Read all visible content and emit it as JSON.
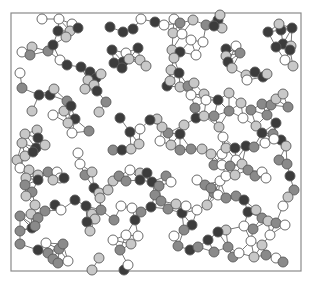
{
  "diagram": {
    "type": "network-graph",
    "frame": {
      "x": 11,
      "y": 13,
      "width": 290,
      "height": 258
    },
    "node_radius": 5,
    "colors": {
      "white": "#ffffff",
      "light": "#c8c8c8",
      "medium": "#8a8a8a",
      "dark": "#3c3c3c",
      "edge": "#6a6a6a",
      "frame": "#8a8a8a"
    },
    "nodes": [
      [
        42,
        19,
        "w"
      ],
      [
        59,
        19,
        "w"
      ],
      [
        72,
        24,
        "w"
      ],
      [
        58,
        31,
        "d"
      ],
      [
        70,
        31,
        "l"
      ],
      [
        66,
        37,
        "l"
      ],
      [
        78,
        28,
        "d"
      ],
      [
        22,
        52,
        "w"
      ],
      [
        32,
        47,
        "l"
      ],
      [
        30,
        55,
        "m"
      ],
      [
        48,
        51,
        "m"
      ],
      [
        53,
        45,
        "d"
      ],
      [
        60,
        60,
        "w"
      ],
      [
        67,
        65,
        "d"
      ],
      [
        20,
        73,
        "w"
      ],
      [
        22,
        88,
        "m"
      ],
      [
        39,
        95,
        "d"
      ],
      [
        50,
        95,
        "d"
      ],
      [
        54,
        89,
        "l"
      ],
      [
        32,
        111,
        "l"
      ],
      [
        53,
        115,
        "w"
      ],
      [
        64,
        111,
        "l"
      ],
      [
        67,
        101,
        "m"
      ],
      [
        71,
        106,
        "d"
      ],
      [
        75,
        119,
        "d"
      ],
      [
        68,
        123,
        "l"
      ],
      [
        72,
        133,
        "w"
      ],
      [
        89,
        131,
        "m"
      ],
      [
        25,
        134,
        "l"
      ],
      [
        37,
        130,
        "l"
      ],
      [
        38,
        138,
        "d"
      ],
      [
        22,
        143,
        "l"
      ],
      [
        36,
        148,
        "d"
      ],
      [
        45,
        145,
        "l"
      ],
      [
        110,
        27,
        "d"
      ],
      [
        123,
        32,
        "d"
      ],
      [
        133,
        29,
        "d"
      ],
      [
        141,
        19,
        "w"
      ],
      [
        155,
        22,
        "d"
      ],
      [
        112,
        50,
        "d"
      ],
      [
        126,
        53,
        "w"
      ],
      [
        138,
        48,
        "d"
      ],
      [
        123,
        62,
        "d"
      ],
      [
        129,
        59,
        "l"
      ],
      [
        140,
        60,
        "l"
      ],
      [
        146,
        66,
        "l"
      ],
      [
        114,
        63,
        "d"
      ],
      [
        122,
        68,
        "d"
      ],
      [
        81,
        67,
        "d"
      ],
      [
        90,
        72,
        "d"
      ],
      [
        96,
        78,
        "d"
      ],
      [
        101,
        74,
        "l"
      ],
      [
        88,
        80,
        "l"
      ],
      [
        94,
        85,
        "l"
      ],
      [
        85,
        89,
        "l"
      ],
      [
        97,
        91,
        "d"
      ],
      [
        106,
        102,
        "m"
      ],
      [
        99,
        112,
        "l"
      ],
      [
        120,
        118,
        "d"
      ],
      [
        130,
        132,
        "d"
      ],
      [
        140,
        129,
        "w"
      ],
      [
        113,
        150,
        "m"
      ],
      [
        122,
        150,
        "d"
      ],
      [
        131,
        149,
        "l"
      ],
      [
        139,
        144,
        "l"
      ],
      [
        164,
        25,
        "w"
      ],
      [
        174,
        19,
        "w"
      ],
      [
        180,
        23,
        "m"
      ],
      [
        193,
        20,
        "l"
      ],
      [
        206,
        25,
        "m"
      ],
      [
        218,
        20,
        "d"
      ],
      [
        222,
        28,
        "l"
      ],
      [
        220,
        15,
        "l"
      ],
      [
        214,
        26,
        "d"
      ],
      [
        173,
        33,
        "l"
      ],
      [
        182,
        34,
        "w"
      ],
      [
        191,
        40,
        "w"
      ],
      [
        203,
        42,
        "w"
      ],
      [
        172,
        50,
        "l"
      ],
      [
        180,
        52,
        "d"
      ],
      [
        174,
        58,
        "l"
      ],
      [
        196,
        55,
        "w"
      ],
      [
        226,
        49,
        "d"
      ],
      [
        236,
        46,
        "w"
      ],
      [
        240,
        53,
        "m"
      ],
      [
        226,
        56,
        "l"
      ],
      [
        228,
        62,
        "d"
      ],
      [
        232,
        68,
        "l"
      ],
      [
        246,
        75,
        "l"
      ],
      [
        255,
        72,
        "d"
      ],
      [
        247,
        80,
        "w"
      ],
      [
        263,
        77,
        "d"
      ],
      [
        267,
        74,
        "l"
      ],
      [
        268,
        32,
        "d"
      ],
      [
        281,
        30,
        "d"
      ],
      [
        292,
        28,
        "d"
      ],
      [
        279,
        24,
        "l"
      ],
      [
        283,
        44,
        "d"
      ],
      [
        291,
        46,
        "l"
      ],
      [
        276,
        47,
        "d"
      ],
      [
        290,
        50,
        "d"
      ],
      [
        285,
        60,
        "w"
      ],
      [
        293,
        66,
        "l"
      ],
      [
        171,
        70,
        "l"
      ],
      [
        179,
        73,
        "d"
      ],
      [
        167,
        86,
        "d"
      ],
      [
        170,
        81,
        "l"
      ],
      [
        180,
        87,
        "l"
      ],
      [
        188,
        86,
        "m"
      ],
      [
        194,
        83,
        "l"
      ],
      [
        191,
        95,
        "w"
      ],
      [
        204,
        94,
        "l"
      ],
      [
        206,
        100,
        "w"
      ],
      [
        218,
        100,
        "d"
      ],
      [
        229,
        93,
        "l"
      ],
      [
        229,
        111,
        "m"
      ],
      [
        241,
        103,
        "l"
      ],
      [
        251,
        110,
        "m"
      ],
      [
        262,
        104,
        "m"
      ],
      [
        271,
        105,
        "m"
      ],
      [
        267,
        115,
        "m"
      ],
      [
        276,
        99,
        "l"
      ],
      [
        283,
        94,
        "l"
      ],
      [
        288,
        107,
        "m"
      ],
      [
        276,
        123,
        "d"
      ],
      [
        273,
        134,
        "m"
      ],
      [
        281,
        140,
        "d"
      ],
      [
        286,
        146,
        "l"
      ],
      [
        195,
        108,
        "m"
      ],
      [
        196,
        118,
        "d"
      ],
      [
        204,
        116,
        "l"
      ],
      [
        214,
        116,
        "m"
      ],
      [
        219,
        127,
        "l"
      ],
      [
        223,
        137,
        "w"
      ],
      [
        243,
        118,
        "w"
      ],
      [
        256,
        126,
        "l"
      ],
      [
        262,
        133,
        "d"
      ],
      [
        265,
        143,
        "w"
      ],
      [
        274,
        139,
        "w"
      ],
      [
        184,
        125,
        "l"
      ],
      [
        180,
        134,
        "d"
      ],
      [
        168,
        133,
        "m"
      ],
      [
        162,
        127,
        "l"
      ],
      [
        157,
        119,
        "l"
      ],
      [
        150,
        120,
        "d"
      ],
      [
        160,
        141,
        "w"
      ],
      [
        171,
        145,
        "l"
      ],
      [
        180,
        150,
        "m"
      ],
      [
        191,
        149,
        "m"
      ],
      [
        202,
        149,
        "l"
      ],
      [
        17,
        160,
        "l"
      ],
      [
        25,
        156,
        "l"
      ],
      [
        33,
        152,
        "d"
      ],
      [
        20,
        168,
        "w"
      ],
      [
        29,
        170,
        "l"
      ],
      [
        26,
        178,
        "l"
      ],
      [
        38,
        175,
        "l"
      ],
      [
        48,
        172,
        "m"
      ],
      [
        57,
        172,
        "w"
      ],
      [
        60,
        178,
        "w"
      ],
      [
        64,
        178,
        "d"
      ],
      [
        53,
        180,
        "l"
      ],
      [
        25,
        185,
        "m"
      ],
      [
        38,
        180,
        "d"
      ],
      [
        32,
        192,
        "m"
      ],
      [
        26,
        196,
        "l"
      ],
      [
        35,
        205,
        "l"
      ],
      [
        45,
        211,
        "m"
      ],
      [
        55,
        205,
        "d"
      ],
      [
        61,
        210,
        "w"
      ],
      [
        20,
        216,
        "m"
      ],
      [
        31,
        214,
        "l"
      ],
      [
        38,
        218,
        "m"
      ],
      [
        20,
        231,
        "m"
      ],
      [
        32,
        228,
        "d"
      ],
      [
        35,
        226,
        "m"
      ],
      [
        20,
        244,
        "m"
      ],
      [
        38,
        250,
        "d"
      ],
      [
        46,
        243,
        "w"
      ],
      [
        48,
        253,
        "m"
      ],
      [
        53,
        259,
        "m"
      ],
      [
        58,
        263,
        "m"
      ],
      [
        59,
        249,
        "m"
      ],
      [
        63,
        244,
        "m"
      ],
      [
        68,
        261,
        "w"
      ],
      [
        78,
        153,
        "w"
      ],
      [
        80,
        164,
        "w"
      ],
      [
        85,
        175,
        "m"
      ],
      [
        92,
        172,
        "l"
      ],
      [
        94,
        188,
        "d"
      ],
      [
        99,
        193,
        "l"
      ],
      [
        108,
        190,
        "l"
      ],
      [
        113,
        181,
        "l"
      ],
      [
        119,
        176,
        "m"
      ],
      [
        126,
        181,
        "m"
      ],
      [
        130,
        170,
        "w"
      ],
      [
        140,
        173,
        "l"
      ],
      [
        140,
        180,
        "d"
      ],
      [
        147,
        173,
        "d"
      ],
      [
        152,
        182,
        "d"
      ],
      [
        159,
        186,
        "m"
      ],
      [
        166,
        176,
        "m"
      ],
      [
        171,
        182,
        "w"
      ],
      [
        121,
        206,
        "w"
      ],
      [
        132,
        208,
        "w"
      ],
      [
        135,
        220,
        "d"
      ],
      [
        141,
        212,
        "m"
      ],
      [
        151,
        207,
        "d"
      ],
      [
        75,
        200,
        "d"
      ],
      [
        86,
        206,
        "d"
      ],
      [
        92,
        214,
        "l"
      ],
      [
        95,
        219,
        "l"
      ],
      [
        87,
        222,
        "d"
      ],
      [
        90,
        231,
        "l"
      ],
      [
        100,
        198,
        "l"
      ],
      [
        101,
        210,
        "m"
      ],
      [
        114,
        220,
        "m"
      ],
      [
        113,
        240,
        "w"
      ],
      [
        120,
        250,
        "m"
      ],
      [
        126,
        235,
        "w"
      ],
      [
        131,
        244,
        "l"
      ],
      [
        138,
        236,
        "w"
      ],
      [
        99,
        258,
        "l"
      ],
      [
        92,
        270,
        "l"
      ],
      [
        124,
        270,
        "d"
      ],
      [
        128,
        265,
        "w"
      ],
      [
        155,
        195,
        "m"
      ],
      [
        161,
        201,
        "m"
      ],
      [
        168,
        209,
        "m"
      ],
      [
        176,
        204,
        "l"
      ],
      [
        182,
        213,
        "d"
      ],
      [
        186,
        206,
        "w"
      ],
      [
        197,
        210,
        "w"
      ],
      [
        207,
        205,
        "l"
      ],
      [
        214,
        193,
        "m"
      ],
      [
        220,
        181,
        "w"
      ],
      [
        226,
        176,
        "w"
      ],
      [
        235,
        175,
        "l"
      ],
      [
        236,
        160,
        "w"
      ],
      [
        242,
        164,
        "l"
      ],
      [
        248,
        170,
        "m"
      ],
      [
        255,
        176,
        "m"
      ],
      [
        262,
        172,
        "w"
      ],
      [
        266,
        178,
        "w"
      ],
      [
        279,
        160,
        "m"
      ],
      [
        287,
        164,
        "m"
      ],
      [
        290,
        176,
        "d"
      ],
      [
        294,
        190,
        "m"
      ],
      [
        288,
        197,
        "l"
      ],
      [
        283,
        206,
        "w"
      ],
      [
        211,
        154,
        "l"
      ],
      [
        222,
        154,
        "w"
      ],
      [
        226,
        148,
        "l"
      ],
      [
        235,
        148,
        "d"
      ],
      [
        246,
        146,
        "d"
      ],
      [
        254,
        147,
        "m"
      ],
      [
        214,
        165,
        "m"
      ],
      [
        222,
        165,
        "w"
      ],
      [
        230,
        166,
        "m"
      ],
      [
        197,
        180,
        "w"
      ],
      [
        205,
        185,
        "m"
      ],
      [
        211,
        188,
        "m"
      ],
      [
        218,
        195,
        "w"
      ],
      [
        226,
        198,
        "m"
      ],
      [
        236,
        196,
        "m"
      ],
      [
        244,
        200,
        "d"
      ],
      [
        248,
        212,
        "d"
      ],
      [
        256,
        210,
        "l"
      ],
      [
        262,
        218,
        "m"
      ],
      [
        268,
        221,
        "l"
      ],
      [
        192,
        225,
        "d"
      ],
      [
        184,
        230,
        "m"
      ],
      [
        174,
        236,
        "w"
      ],
      [
        178,
        246,
        "m"
      ],
      [
        190,
        250,
        "d"
      ],
      [
        198,
        247,
        "m"
      ],
      [
        208,
        240,
        "d"
      ],
      [
        214,
        252,
        "m"
      ],
      [
        233,
        257,
        "m"
      ],
      [
        239,
        253,
        "w"
      ],
      [
        228,
        247,
        "m"
      ],
      [
        251,
        241,
        "w"
      ],
      [
        262,
        245,
        "l"
      ],
      [
        270,
        235,
        "w"
      ],
      [
        276,
        223,
        "m"
      ],
      [
        285,
        225,
        "w"
      ],
      [
        254,
        257,
        "l"
      ],
      [
        266,
        255,
        "m"
      ],
      [
        276,
        258,
        "w"
      ],
      [
        283,
        262,
        "m"
      ],
      [
        244,
        226,
        "w"
      ],
      [
        253,
        229,
        "m"
      ],
      [
        226,
        230,
        "l"
      ],
      [
        218,
        232,
        "d"
      ]
    ],
    "edges": "proximity"
  }
}
